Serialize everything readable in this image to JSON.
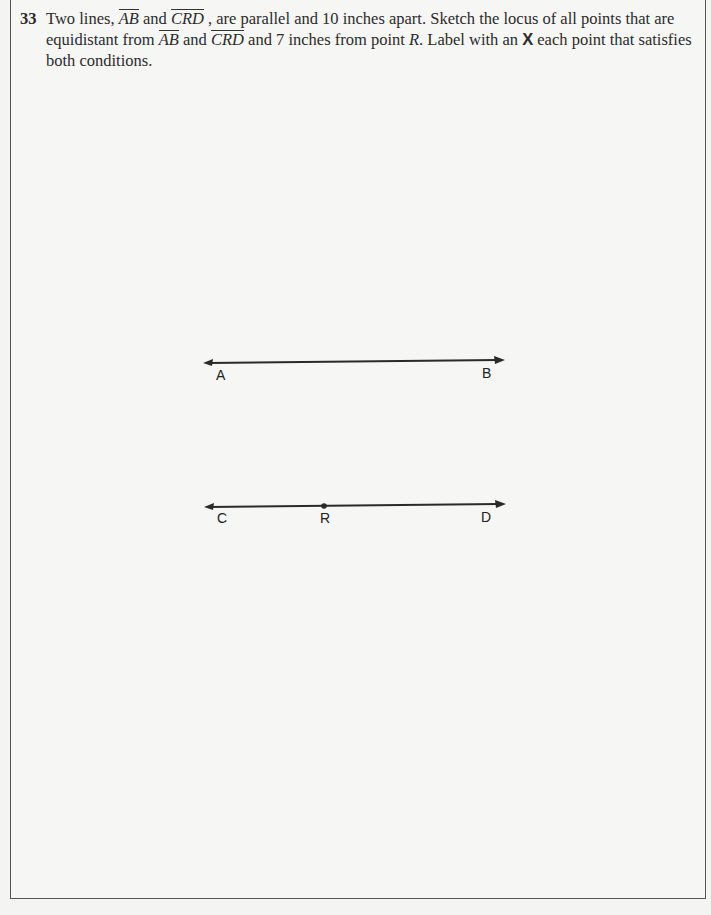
{
  "question": {
    "number": "33",
    "line1_a": "Two lines, ",
    "line_ab": "AB",
    "line1_b": " and ",
    "line_crd": "CRD",
    "line1_c": " , are parallel and 10 inches apart. Sketch the locus of all points that are",
    "line2_a": "equidistant from ",
    "line2_b": " and ",
    "line2_c": " and 7 inches from point ",
    "point_r": "R",
    "line2_d": ". Label with an ",
    "x_mark": "X",
    "line2_e": " each point that satisfies",
    "line3": "both conditions."
  },
  "figure": {
    "line_ab": {
      "left_label": "A",
      "right_label": "B"
    },
    "line_crd": {
      "left_label": "C",
      "mid_label": "R",
      "right_label": "D"
    }
  }
}
